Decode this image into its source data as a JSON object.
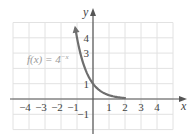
{
  "chart_data": {
    "type": "line",
    "title": "",
    "xlabel": "x",
    "ylabel": "y",
    "xlim": [
      -5,
      5
    ],
    "ylim": [
      -2,
      5
    ],
    "grid": true,
    "x_ticks": [
      "−4",
      "−3",
      "−2",
      "−1",
      "1",
      "2",
      "3",
      "4"
    ],
    "x_tick_values": [
      -4,
      -3,
      -2,
      -1,
      1,
      2,
      3,
      4
    ],
    "y_ticks": [
      "4",
      "3",
      "1",
      "−1"
    ],
    "y_tick_values": [
      4,
      3,
      1,
      -1
    ],
    "series": [
      {
        "name": "f(x) = 4^(−x)",
        "label_text": "f(x) = 4",
        "label_exponent": "−x",
        "color": "#6e6e6e",
        "x": [
          -1.13,
          -1,
          -0.75,
          -0.5,
          -0.25,
          0,
          0.25,
          0.5,
          0.75,
          1,
          1.25,
          1.5,
          1.75,
          2
        ],
        "y": [
          4.79,
          4,
          2.83,
          2,
          1.41,
          1,
          0.71,
          0.5,
          0.35,
          0.25,
          0.18,
          0.125,
          0.09,
          0.0625
        ]
      }
    ]
  },
  "colors": {
    "grid": "#e2e2e2",
    "axis": "#555555",
    "curve": "#6e6e6e"
  }
}
